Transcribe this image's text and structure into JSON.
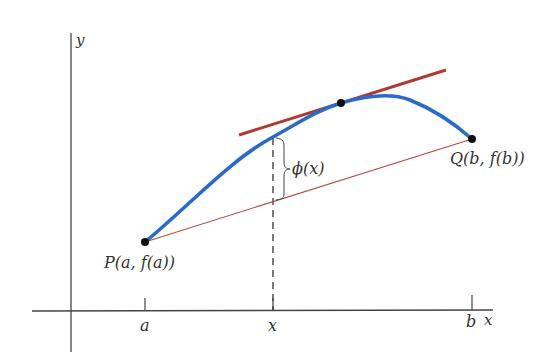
{
  "diagram": {
    "axes": {
      "x_label": "x",
      "y_label": "y",
      "ticks": [
        {
          "label": "a",
          "px": 145
        },
        {
          "label": "x",
          "px": 273
        },
        {
          "label": "b",
          "px": 472
        }
      ]
    },
    "points": {
      "P": {
        "label": "P(a, f(a))",
        "px": [
          145,
          242
        ]
      },
      "Q": {
        "label": "Q(b, f(b))",
        "px": [
          472,
          139
        ]
      },
      "tangent_point": {
        "px": [
          341,
          103
        ]
      }
    },
    "annotation": {
      "phi_label": "ϕ(x)"
    },
    "colors": {
      "curve": "#2a6bc9",
      "tangent_line": "#b03a32",
      "secant_line": "#b54a40",
      "axes": "#444444",
      "points": "#111111",
      "text": "#333333"
    }
  }
}
